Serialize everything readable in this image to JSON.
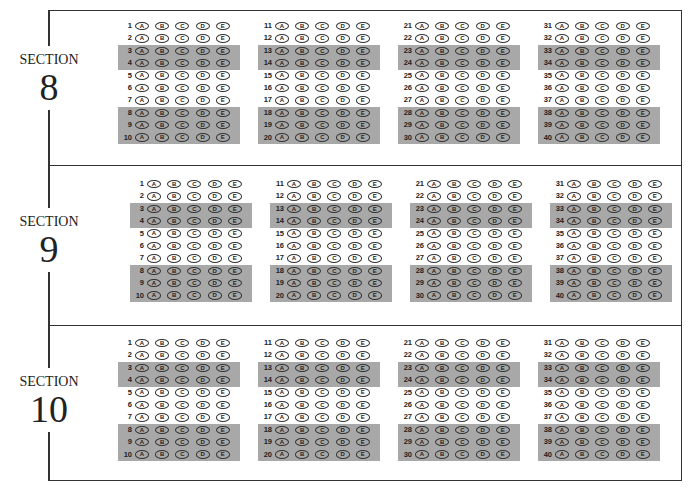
{
  "choices": [
    "A",
    "B",
    "C",
    "D",
    "E"
  ],
  "sections": [
    {
      "word": "SECTION",
      "number": "8",
      "columns": [
        [
          1,
          2,
          3,
          4,
          5,
          6,
          7,
          8,
          9,
          10
        ],
        [
          11,
          12,
          13,
          14,
          15,
          16,
          17,
          18,
          19,
          20
        ],
        [
          21,
          22,
          23,
          24,
          25,
          26,
          27,
          28,
          29,
          30
        ],
        [
          31,
          32,
          33,
          34,
          35,
          36,
          37,
          38,
          39,
          40
        ]
      ]
    },
    {
      "word": "SECTION",
      "number": "9",
      "columns": [
        [
          1,
          2,
          3,
          4,
          5,
          6,
          7,
          8,
          9,
          10
        ],
        [
          11,
          12,
          13,
          14,
          15,
          16,
          17,
          18,
          19,
          20
        ],
        [
          21,
          22,
          23,
          24,
          25,
          26,
          27,
          28,
          29,
          30
        ],
        [
          31,
          32,
          33,
          34,
          35,
          36,
          37,
          38,
          39,
          40
        ]
      ]
    },
    {
      "word": "SECTION",
      "number": "10",
      "columns": [
        [
          1,
          2,
          3,
          4,
          5,
          6,
          7,
          8,
          9,
          10
        ],
        [
          11,
          12,
          13,
          14,
          15,
          16,
          17,
          18,
          19,
          20
        ],
        [
          21,
          22,
          23,
          24,
          25,
          26,
          27,
          28,
          29,
          30
        ],
        [
          31,
          32,
          33,
          34,
          35,
          36,
          37,
          38,
          39,
          40
        ]
      ]
    }
  ],
  "shaded_row_indices": [
    2,
    3,
    7,
    8,
    9
  ],
  "colors": {
    "shade": "#a8a8a8",
    "line": "#333333"
  }
}
